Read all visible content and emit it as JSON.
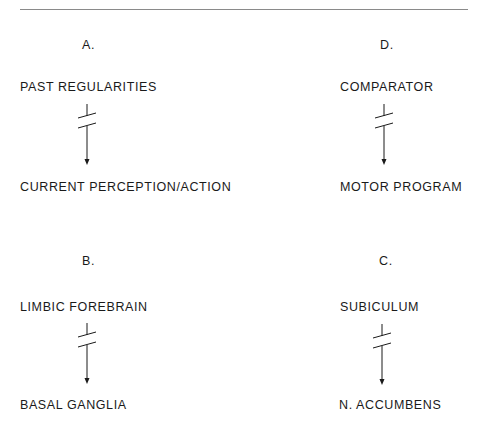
{
  "figure": {
    "panels": [
      {
        "id": "A",
        "letter": "A.",
        "source": "PAST REGULARITIES",
        "target": "CURRENT PERCEPTION/ACTION",
        "connection": "interrupted-arrow"
      },
      {
        "id": "D",
        "letter": "D.",
        "source": "COMPARATOR",
        "target": "MOTOR PROGRAM",
        "connection": "interrupted-arrow"
      },
      {
        "id": "B",
        "letter": "B.",
        "source": "LIMBIC FOREBRAIN",
        "target": "BASAL GANGLIA",
        "connection": "interrupted-arrow"
      },
      {
        "id": "C",
        "letter": "C.",
        "source": "SUBICULUM",
        "target": "N. ACCUMBENS",
        "connection": "interrupted-arrow"
      }
    ]
  }
}
